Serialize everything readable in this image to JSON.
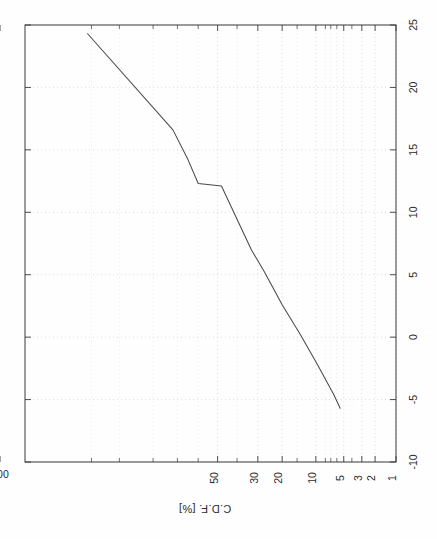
{
  "figure": {
    "kind": "cdf-probability-plot",
    "orientation_note": "rotated-90-degrees",
    "background_color": "#fefefe",
    "line_color": "#4a4a4a",
    "grid_color": "#c8c8c8",
    "frame_color": "#3a3a3a"
  },
  "chart_data": {
    "type": "line",
    "title": "",
    "subtitle": "",
    "xlabel": "C.D.F. [%]",
    "ylabel": "",
    "xlim": [
      100,
      1
    ],
    "ylim": [
      -10,
      25
    ],
    "x_scale": "normal-probability",
    "y_scale": "linear",
    "grid": true,
    "legend": null,
    "legend_position": "none",
    "x_tick_labels": [
      "100",
      "50",
      "30",
      "20",
      "10",
      "5",
      "3",
      "2",
      "1"
    ],
    "x_tick_values": [
      100,
      50,
      30,
      20,
      10,
      5,
      3,
      2,
      1
    ],
    "x_minor_tick_values": [
      95,
      90,
      80,
      70,
      60,
      40,
      15,
      8,
      7,
      6,
      4
    ],
    "y_tick_labels": [
      "25",
      "20",
      "15",
      "10",
      "5",
      "0",
      "-5",
      "-10"
    ],
    "y_tick_values": [
      25,
      20,
      15,
      10,
      5,
      0,
      -5,
      -10
    ],
    "y_minor_tick_values": [],
    "corner_label": "-10",
    "series": [
      {
        "name": "cdf-curve",
        "color": "#4a4a4a",
        "cdf_percent": [
          95.5,
          72.0,
          65.0,
          60.0,
          48.0,
          33.0,
          27.0,
          20.0,
          14.0,
          9.5,
          6.5,
          5.5
        ],
        "value": [
          24.3,
          16.6,
          14.2,
          12.3,
          12.1,
          7.0,
          5.2,
          2.6,
          0.2,
          -2.3,
          -4.6,
          -5.7
        ],
        "points": [
          {
            "cdf_percent": 95.5,
            "value": 24.3
          },
          {
            "cdf_percent": 72.0,
            "value": 16.6
          },
          {
            "cdf_percent": 65.0,
            "value": 14.2
          },
          {
            "cdf_percent": 60.0,
            "value": 12.3
          },
          {
            "cdf_percent": 48.0,
            "value": 12.1
          },
          {
            "cdf_percent": 33.0,
            "value": 7.0
          },
          {
            "cdf_percent": 27.0,
            "value": 5.2
          },
          {
            "cdf_percent": 20.0,
            "value": 2.6
          },
          {
            "cdf_percent": 14.0,
            "value": 0.2
          },
          {
            "cdf_percent": 9.5,
            "value": -2.3
          },
          {
            "cdf_percent": 6.5,
            "value": -4.6
          },
          {
            "cdf_percent": 5.5,
            "value": -5.7
          }
        ]
      }
    ]
  },
  "labels": {
    "axis_title_cdf": "C.D.F. [%]",
    "x_100": "100",
    "x_50": "50",
    "x_30": "30",
    "x_20": "20",
    "x_10": "10",
    "x_5": "5",
    "x_3": "3",
    "x_2": "2",
    "x_1": "1",
    "y_25": "25",
    "y_20": "20",
    "y_15": "15",
    "y_10": "10",
    "y_5": "5",
    "y_0": "0",
    "y_m5": "-5",
    "y_m10": "-10"
  }
}
